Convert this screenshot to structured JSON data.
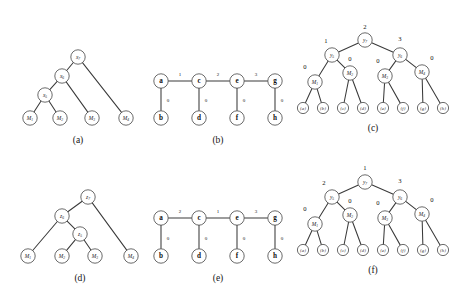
{
  "figure": {
    "background_color": "#ffffff",
    "stroke_color": "#3a3a3a",
    "node_fill": "#ffffff",
    "panels": [
      {
        "id": "a",
        "caption": "(a)",
        "type": "tree",
        "nodes": [
          {
            "name": "x7",
            "label": "x",
            "sub": "7",
            "x": 78,
            "y": 57
          },
          {
            "name": "x6",
            "label": "x",
            "sub": "6",
            "x": 62,
            "y": 76
          },
          {
            "name": "x5",
            "label": "x",
            "sub": "5",
            "x": 45,
            "y": 95
          },
          {
            "name": "M1",
            "label": "M",
            "sub": "1",
            "x": 30,
            "y": 118
          },
          {
            "name": "M2",
            "label": "M",
            "sub": "2",
            "x": 60,
            "y": 118
          },
          {
            "name": "M3",
            "label": "M",
            "sub": "3",
            "x": 92,
            "y": 118
          },
          {
            "name": "M4",
            "label": "M",
            "sub": "4",
            "x": 126,
            "y": 118
          }
        ],
        "edges": [
          {
            "from": "x7",
            "to": "x6"
          },
          {
            "from": "x7",
            "to": "M4"
          },
          {
            "from": "x6",
            "to": "x5"
          },
          {
            "from": "x6",
            "to": "M3"
          },
          {
            "from": "x5",
            "to": "M1"
          },
          {
            "from": "x5",
            "to": "M2"
          }
        ],
        "caption_x": 78,
        "caption_y": 140
      },
      {
        "id": "b",
        "caption": "(b)",
        "type": "chain",
        "nodes": [
          {
            "name": "a",
            "label": "a",
            "x": 161,
            "y": 81
          },
          {
            "name": "b",
            "label": "b",
            "x": 161,
            "y": 118
          },
          {
            "name": "c",
            "label": "c",
            "x": 199,
            "y": 81
          },
          {
            "name": "d",
            "label": "d",
            "x": 199,
            "y": 118
          },
          {
            "name": "e",
            "label": "e",
            "x": 237,
            "y": 81
          },
          {
            "name": "f",
            "label": "f",
            "x": 237,
            "y": 118
          },
          {
            "name": "g",
            "label": "g",
            "x": 275,
            "y": 81
          },
          {
            "name": "h",
            "label": "h",
            "x": 275,
            "y": 118
          }
        ],
        "edges": [
          {
            "from": "a",
            "to": "c",
            "weight": "1",
            "wx": 180,
            "wy": 74
          },
          {
            "from": "c",
            "to": "e",
            "weight": "2",
            "wx": 218,
            "wy": 74
          },
          {
            "from": "e",
            "to": "g",
            "weight": "3",
            "wx": 256,
            "wy": 74
          },
          {
            "from": "a",
            "to": "b",
            "weight": "0",
            "wx": 168,
            "wy": 100
          },
          {
            "from": "c",
            "to": "d",
            "weight": "0",
            "wx": 206,
            "wy": 100
          },
          {
            "from": "e",
            "to": "f",
            "weight": "0",
            "wx": 244,
            "wy": 100
          },
          {
            "from": "g",
            "to": "h",
            "weight": "0",
            "wx": 282,
            "wy": 100
          }
        ],
        "caption_x": 218,
        "caption_y": 140
      },
      {
        "id": "c",
        "caption": "(c)",
        "type": "weighted-tree",
        "nodes": [
          {
            "name": "y7",
            "label": "y",
            "sub": "7",
            "x": 365,
            "y": 40,
            "weight": "2",
            "wx": 365,
            "wy": 26
          },
          {
            "name": "y5",
            "label": "y",
            "sub": "5",
            "x": 332,
            "y": 55,
            "weight": "1",
            "wx": 326,
            "wy": 40
          },
          {
            "name": "y6",
            "label": "y",
            "sub": "6",
            "x": 400,
            "y": 55,
            "weight": "3",
            "wx": 400,
            "wy": 38
          },
          {
            "name": "M1",
            "label": "M",
            "sub": "1",
            "x": 315,
            "y": 82,
            "weight": "0",
            "wx": 305,
            "wy": 66
          },
          {
            "name": "M2",
            "label": "M",
            "sub": "2",
            "x": 350,
            "y": 73,
            "weight": "0",
            "wx": 350,
            "wy": 58
          },
          {
            "name": "M3",
            "label": "M",
            "sub": "3",
            "x": 385,
            "y": 76,
            "weight": "0",
            "wx": 378,
            "wy": 60
          },
          {
            "name": "M4",
            "label": "M",
            "sub": "4",
            "x": 422,
            "y": 72,
            "weight": "0",
            "wx": 432,
            "wy": 57
          }
        ],
        "leaves": [
          {
            "name": "leaf-a",
            "label": "{a}",
            "x": 303,
            "y": 108
          },
          {
            "name": "leaf-b",
            "label": "{b}",
            "x": 323,
            "y": 108
          },
          {
            "name": "leaf-c",
            "label": "{c}",
            "x": 343,
            "y": 108
          },
          {
            "name": "leaf-d",
            "label": "{d}",
            "x": 363,
            "y": 108
          },
          {
            "name": "leaf-e",
            "label": "{e}",
            "x": 383,
            "y": 108
          },
          {
            "name": "leaf-f",
            "label": "{f}",
            "x": 403,
            "y": 108
          },
          {
            "name": "leaf-g",
            "label": "{g}",
            "x": 423,
            "y": 108
          },
          {
            "name": "leaf-h",
            "label": "{h}",
            "x": 443,
            "y": 108
          }
        ],
        "edges": [
          {
            "from": "y7",
            "to": "y5"
          },
          {
            "from": "y7",
            "to": "y6"
          },
          {
            "from": "y5",
            "to": "M1"
          },
          {
            "from": "y5",
            "to": "M2"
          },
          {
            "from": "y6",
            "to": "M3"
          },
          {
            "from": "y6",
            "to": "M4"
          },
          {
            "from": "M1",
            "to": "leaf-a"
          },
          {
            "from": "M1",
            "to": "leaf-b"
          },
          {
            "from": "M2",
            "to": "leaf-c"
          },
          {
            "from": "M2",
            "to": "leaf-d"
          },
          {
            "from": "M3",
            "to": "leaf-e"
          },
          {
            "from": "M3",
            "to": "leaf-f"
          },
          {
            "from": "M4",
            "to": "leaf-g"
          },
          {
            "from": "M4",
            "to": "leaf-h"
          }
        ],
        "caption_x": 373,
        "caption_y": 128
      },
      {
        "id": "d",
        "caption": "(d)",
        "type": "tree",
        "nodes": [
          {
            "name": "z7",
            "label": "z",
            "sub": "7",
            "x": 88,
            "y": 197
          },
          {
            "name": "z6",
            "label": "z",
            "sub": "6",
            "x": 62,
            "y": 216
          },
          {
            "name": "z5",
            "label": "z",
            "sub": "5",
            "x": 80,
            "y": 234
          },
          {
            "name": "M1",
            "label": "M",
            "sub": "1",
            "x": 28,
            "y": 256
          },
          {
            "name": "M2",
            "label": "M",
            "sub": "2",
            "x": 62,
            "y": 256
          },
          {
            "name": "M3",
            "label": "M",
            "sub": "3",
            "x": 95,
            "y": 256
          },
          {
            "name": "M4",
            "label": "M",
            "sub": "4",
            "x": 131,
            "y": 256
          }
        ],
        "edges": [
          {
            "from": "z7",
            "to": "z6"
          },
          {
            "from": "z7",
            "to": "M4"
          },
          {
            "from": "z6",
            "to": "M1"
          },
          {
            "from": "z6",
            "to": "z5"
          },
          {
            "from": "z5",
            "to": "M2"
          },
          {
            "from": "z5",
            "to": "M3"
          }
        ],
        "caption_x": 80,
        "caption_y": 278
      },
      {
        "id": "e",
        "caption": "(e)",
        "type": "chain",
        "nodes": [
          {
            "name": "a",
            "label": "a",
            "x": 161,
            "y": 218
          },
          {
            "name": "b",
            "label": "b",
            "x": 161,
            "y": 256
          },
          {
            "name": "c",
            "label": "c",
            "x": 199,
            "y": 218
          },
          {
            "name": "d",
            "label": "d",
            "x": 199,
            "y": 256
          },
          {
            "name": "e",
            "label": "e",
            "x": 237,
            "y": 218
          },
          {
            "name": "f",
            "label": "f",
            "x": 237,
            "y": 256
          },
          {
            "name": "g",
            "label": "g",
            "x": 275,
            "y": 218
          },
          {
            "name": "h",
            "label": "h",
            "x": 275,
            "y": 256
          }
        ],
        "edges": [
          {
            "from": "a",
            "to": "c",
            "weight": "2",
            "wx": 180,
            "wy": 211
          },
          {
            "from": "c",
            "to": "e",
            "weight": "1",
            "wx": 218,
            "wy": 211
          },
          {
            "from": "e",
            "to": "g",
            "weight": "3",
            "wx": 256,
            "wy": 211
          },
          {
            "from": "a",
            "to": "b",
            "weight": "0",
            "wx": 168,
            "wy": 238
          },
          {
            "from": "c",
            "to": "d",
            "weight": "0",
            "wx": 206,
            "wy": 238
          },
          {
            "from": "e",
            "to": "f",
            "weight": "0",
            "wx": 244,
            "wy": 238
          },
          {
            "from": "g",
            "to": "h",
            "weight": "0",
            "wx": 282,
            "wy": 238
          }
        ],
        "caption_x": 218,
        "caption_y": 278
      },
      {
        "id": "f",
        "caption": "(f)",
        "type": "weighted-tree",
        "nodes": [
          {
            "name": "y7",
            "label": "y",
            "sub": "7",
            "x": 365,
            "y": 182,
            "weight": "1",
            "wx": 365,
            "wy": 167
          },
          {
            "name": "y5",
            "label": "y",
            "sub": "5",
            "x": 332,
            "y": 197,
            "weight": "2",
            "wx": 324,
            "wy": 182
          },
          {
            "name": "y6",
            "label": "y",
            "sub": "6",
            "x": 400,
            "y": 197,
            "weight": "3",
            "wx": 400,
            "wy": 180
          },
          {
            "name": "M1",
            "label": "M",
            "sub": "1",
            "x": 315,
            "y": 224,
            "weight": "0",
            "wx": 305,
            "wy": 208
          },
          {
            "name": "M2",
            "label": "M",
            "sub": "2",
            "x": 350,
            "y": 215,
            "weight": "0",
            "wx": 350,
            "wy": 200
          },
          {
            "name": "M3",
            "label": "M",
            "sub": "3",
            "x": 385,
            "y": 218,
            "weight": "0",
            "wx": 378,
            "wy": 202
          },
          {
            "name": "M4",
            "label": "M",
            "sub": "4",
            "x": 422,
            "y": 214,
            "weight": "0",
            "wx": 432,
            "wy": 199
          }
        ],
        "leaves": [
          {
            "name": "leaf-a",
            "label": "{a}",
            "x": 303,
            "y": 250
          },
          {
            "name": "leaf-b",
            "label": "{b}",
            "x": 323,
            "y": 250
          },
          {
            "name": "leaf-c",
            "label": "{c}",
            "x": 343,
            "y": 250
          },
          {
            "name": "leaf-d",
            "label": "{d}",
            "x": 363,
            "y": 250
          },
          {
            "name": "leaf-e",
            "label": "{e}",
            "x": 383,
            "y": 250
          },
          {
            "name": "leaf-f",
            "label": "{f}",
            "x": 403,
            "y": 250
          },
          {
            "name": "leaf-g",
            "label": "{g}",
            "x": 423,
            "y": 250
          },
          {
            "name": "leaf-h",
            "label": "{h}",
            "x": 443,
            "y": 250
          }
        ],
        "edges": [
          {
            "from": "y7",
            "to": "y5"
          },
          {
            "from": "y7",
            "to": "y6"
          },
          {
            "from": "y5",
            "to": "M1"
          },
          {
            "from": "y5",
            "to": "M2"
          },
          {
            "from": "y6",
            "to": "M3"
          },
          {
            "from": "y6",
            "to": "M4"
          },
          {
            "from": "M1",
            "to": "leaf-a"
          },
          {
            "from": "M1",
            "to": "leaf-b"
          },
          {
            "from": "M2",
            "to": "leaf-c"
          },
          {
            "from": "M2",
            "to": "leaf-d"
          },
          {
            "from": "M3",
            "to": "leaf-e"
          },
          {
            "from": "M3",
            "to": "leaf-f"
          },
          {
            "from": "M4",
            "to": "leaf-g"
          },
          {
            "from": "M4",
            "to": "leaf-h"
          }
        ],
        "caption_x": 373,
        "caption_y": 270
      }
    ]
  }
}
